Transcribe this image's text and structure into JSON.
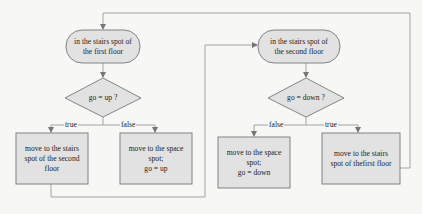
{
  "diagram": {
    "type": "flowchart",
    "colors": {
      "node_fill": "#e2e2e2",
      "stroke": "#777777",
      "line": "#9a9a9a",
      "background": "#f7f7f5"
    },
    "nodes": {
      "start1": {
        "text": "in the stairs spot of the first floor",
        "lines": [
          "in the stairs spot of",
          "the first floor"
        ],
        "shape": "terminal"
      },
      "dec1": {
        "text": "go = up ?",
        "shape": "decision"
      },
      "act1_true": {
        "lines": [
          "move to the stairs",
          "spot of the second",
          "floor"
        ],
        "shape": "process"
      },
      "act1_false": {
        "lines": [
          "move to the space",
          "spot;",
          "go = up"
        ],
        "shape": "process"
      },
      "start2": {
        "text": "in the stairs spot of the second floor",
        "lines": [
          "in the stairs spot of",
          "the second floor"
        ],
        "shape": "terminal"
      },
      "dec2": {
        "text": "go = down ?",
        "shape": "decision"
      },
      "act2_false": {
        "lines": [
          "move to the space",
          "spot;",
          "go = down"
        ],
        "shape": "process"
      },
      "act2_true": {
        "lines": [
          "move to the stairs",
          "spot of thefirst floor"
        ],
        "shape": "process"
      }
    },
    "edge_labels": {
      "dec1_true": "true",
      "dec1_false": "false",
      "dec2_false": "false",
      "dec2_true": "true"
    },
    "edges": [
      {
        "from": "start1",
        "to": "dec1"
      },
      {
        "from": "dec1",
        "to": "act1_true",
        "label": "true"
      },
      {
        "from": "dec1",
        "to": "act1_false",
        "label": "false"
      },
      {
        "from": "act1_true",
        "to": "start2"
      },
      {
        "from": "start2",
        "to": "dec2"
      },
      {
        "from": "dec2",
        "to": "act2_false",
        "label": "false"
      },
      {
        "from": "dec2",
        "to": "act2_true",
        "label": "true"
      },
      {
        "from": "act2_true",
        "to": "start1"
      }
    ]
  }
}
